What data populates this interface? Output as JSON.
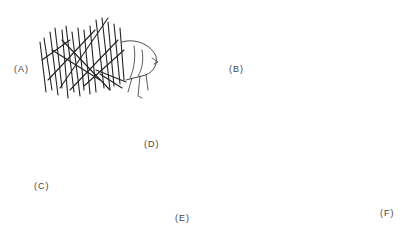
{
  "figure": {
    "panels": [
      {
        "id": "A",
        "label": "(A)",
        "subject": "larva in stick case"
      },
      {
        "id": "B",
        "label": "(B)",
        "subject": "segmented worm-like larva with tuft"
      },
      {
        "id": "C",
        "label": "(C)",
        "subject": "vertical larva with wing pads"
      },
      {
        "id": "D",
        "label": "(D)",
        "subject": "segmented larva with prolegs"
      },
      {
        "id": "E",
        "label": "(E)",
        "subject": "segmented larva with head fans"
      },
      {
        "id": "F",
        "label": "(F)",
        "subject": "larva with paired fan brushes"
      }
    ]
  }
}
